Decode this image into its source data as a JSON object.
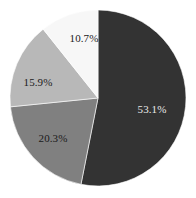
{
  "chart_data": {
    "type": "pie",
    "title": "",
    "subtitle": "",
    "xlabel": "",
    "ylabel": "",
    "grid": false,
    "legend": "none",
    "start_angle_deg": 0,
    "direction": "clockwise",
    "categories": [
      "Segment 1",
      "Segment 2",
      "Segment 3",
      "Segment 4"
    ],
    "values": [
      53.1,
      20.3,
      15.9,
      10.7
    ],
    "data_labels": [
      "53.1%",
      "20.3%",
      "15.9%",
      "10.7%"
    ],
    "slice_colors": [
      "#333333",
      "#808080",
      "#b8b8b8",
      "#f7f7f7"
    ],
    "label_colors": [
      "#e8e8e8",
      "#1a1a1a",
      "#1a1a1a",
      "#1a1a1a"
    ],
    "slices": [
      {
        "label": "53.1%",
        "value": 53.1,
        "color": "#333333",
        "label_color": "#e8e8e8",
        "label_x": 152,
        "label_y": 110,
        "path": "M 98 10 A 88 88 0 1 1 62.6 179.5 L 98 98 Z"
      },
      {
        "label": "20.3%",
        "value": 20.3,
        "color": "#808080",
        "label_color": "#1a1a1a",
        "label_x": 53,
        "label_y": 139,
        "path": "M 62.6 179.5 A 88 88 0 0 1 11.2 115.5 L 98 98 Z"
      },
      {
        "label": "15.9%",
        "value": 15.9,
        "color": "#b8b8b8",
        "label_color": "#1a1a1a",
        "label_x": 38,
        "label_y": 83,
        "path": "M 11.2 115.5 A 88 88 0 0 1 46.3 28.4 L 98 98 Z"
      },
      {
        "label": "10.7%",
        "value": 10.7,
        "color": "#f7f7f7",
        "label_color": "#1a1a1a",
        "label_x": 84,
        "label_y": 39,
        "path": "M 46.3 28.4 A 88 88 0 0 1 98 10 L 98 98 Z"
      }
    ],
    "center": [
      98,
      98
    ],
    "radius": 88
  }
}
